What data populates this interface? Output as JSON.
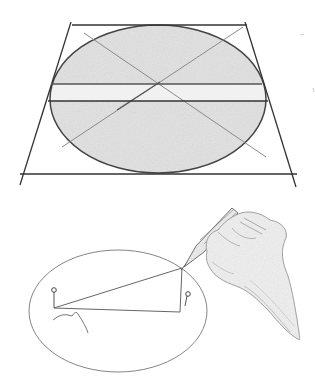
{
  "image": {
    "description": "Pencil sketch illustrating how to draw an ellipse: a shaded ellipse inscribed in a trapezoid with diagonals and horizontal axis lines; below, a hand holding a pencil drawing an ellipse with the pin-and-string method (two pins, a looped string).",
    "top_figure": "Ellipse inscribed in perspective trapezoid with crossing diagonals",
    "bottom_figure": "Hand drawing ellipse using two pins and string"
  },
  "colors": {
    "paper": "#ffffff",
    "graphite_dark": "#3a3a3a",
    "graphite_mid": "#6e6e6e",
    "graphite_light": "#9a9a9a",
    "shading": "#e4e4e4"
  }
}
